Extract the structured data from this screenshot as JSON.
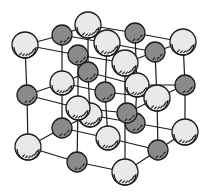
{
  "diagram": {
    "title": "",
    "type": "crystal-lattice",
    "colors": {
      "background": "#ffffff",
      "bond": "#1a1a1a",
      "light_atom": "#e9e9e9",
      "dark_atom": "#8a8a8a",
      "outline": "#1a1a1a"
    },
    "atoms": [
      {
        "kind": "dark",
        "x": 135,
        "y": 123,
        "r": 10
      },
      {
        "kind": "dark",
        "x": 127,
        "y": 113,
        "r": 10
      },
      {
        "kind": "light",
        "x": 90,
        "y": 115,
        "r": 12
      },
      {
        "kind": "light",
        "x": 78,
        "y": 108,
        "r": 12
      },
      {
        "kind": "dark",
        "x": 62,
        "y": 35,
        "r": 10
      },
      {
        "kind": "dark",
        "x": 135,
        "y": 33,
        "r": 10
      },
      {
        "kind": "light",
        "x": 88,
        "y": 25,
        "r": 13
      },
      {
        "kind": "light",
        "x": 25,
        "y": 45,
        "r": 13
      },
      {
        "kind": "light",
        "x": 183,
        "y": 42,
        "r": 13
      },
      {
        "kind": "dark",
        "x": 78,
        "y": 55,
        "r": 10
      },
      {
        "kind": "light",
        "x": 107,
        "y": 43,
        "r": 13
      },
      {
        "kind": "dark",
        "x": 155,
        "y": 52,
        "r": 10
      },
      {
        "kind": "light",
        "x": 125,
        "y": 63,
        "r": 13
      },
      {
        "kind": "dark",
        "x": 88,
        "y": 72,
        "r": 10
      },
      {
        "kind": "light",
        "x": 62,
        "y": 83,
        "r": 12
      },
      {
        "kind": "light",
        "x": 137,
        "y": 85,
        "r": 12
      },
      {
        "kind": "dark",
        "x": 185,
        "y": 85,
        "r": 10
      },
      {
        "kind": "dark",
        "x": 105,
        "y": 92,
        "r": 10
      },
      {
        "kind": "dark",
        "x": 27,
        "y": 95,
        "r": 10
      },
      {
        "kind": "light",
        "x": 157,
        "y": 98,
        "r": 13
      },
      {
        "kind": "dark",
        "x": 62,
        "y": 128,
        "r": 10
      },
      {
        "kind": "light",
        "x": 185,
        "y": 132,
        "r": 13
      },
      {
        "kind": "light",
        "x": 108,
        "y": 138,
        "r": 12
      },
      {
        "kind": "light",
        "x": 28,
        "y": 147,
        "r": 13
      },
      {
        "kind": "dark",
        "x": 158,
        "y": 150,
        "r": 10
      },
      {
        "kind": "dark",
        "x": 77,
        "y": 162,
        "r": 10
      },
      {
        "kind": "light",
        "x": 125,
        "y": 172,
        "r": 13
      }
    ],
    "bonds": [
      [
        25,
        45,
        62,
        35
      ],
      [
        62,
        35,
        88,
        25
      ],
      [
        88,
        25,
        135,
        33
      ],
      [
        135,
        33,
        183,
        42
      ],
      [
        25,
        45,
        78,
        55
      ],
      [
        78,
        55,
        125,
        63
      ],
      [
        125,
        63,
        155,
        52
      ],
      [
        155,
        52,
        183,
        42
      ],
      [
        62,
        35,
        107,
        43
      ],
      [
        107,
        43,
        155,
        52
      ],
      [
        88,
        25,
        107,
        43
      ],
      [
        25,
        45,
        27,
        95
      ],
      [
        183,
        42,
        185,
        85
      ],
      [
        125,
        63,
        125,
        172
      ],
      [
        62,
        35,
        62,
        128
      ],
      [
        135,
        33,
        137,
        85
      ],
      [
        107,
        43,
        105,
        92
      ],
      [
        88,
        25,
        88,
        72
      ],
      [
        27,
        95,
        62,
        83
      ],
      [
        62,
        83,
        88,
        72
      ],
      [
        88,
        72,
        137,
        85
      ],
      [
        137,
        85,
        185,
        85
      ],
      [
        27,
        95,
        78,
        108
      ],
      [
        78,
        108,
        127,
        113
      ],
      [
        127,
        113,
        157,
        98
      ],
      [
        157,
        98,
        185,
        85
      ],
      [
        62,
        83,
        105,
        92
      ],
      [
        105,
        92,
        157,
        98
      ],
      [
        78,
        55,
        78,
        108
      ],
      [
        155,
        52,
        157,
        98
      ],
      [
        28,
        147,
        62,
        128
      ],
      [
        62,
        128,
        108,
        138
      ],
      [
        108,
        138,
        158,
        150
      ],
      [
        158,
        150,
        185,
        132
      ],
      [
        28,
        147,
        77,
        162
      ],
      [
        77,
        162,
        125,
        172
      ],
      [
        125,
        172,
        158,
        150
      ],
      [
        62,
        128,
        90,
        115
      ],
      [
        90,
        115,
        135,
        123
      ],
      [
        135,
        123,
        185,
        132
      ],
      [
        27,
        95,
        28,
        147
      ],
      [
        185,
        85,
        185,
        132
      ],
      [
        78,
        108,
        77,
        162
      ],
      [
        157,
        98,
        158,
        150
      ],
      [
        105,
        92,
        108,
        138
      ],
      [
        137,
        85,
        135,
        123
      ],
      [
        88,
        72,
        90,
        115
      ]
    ]
  }
}
